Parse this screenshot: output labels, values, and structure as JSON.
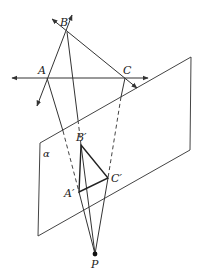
{
  "diagram": {
    "type": "central-projection-geometry",
    "labels": {
      "A": "A",
      "B": "B",
      "C": "C",
      "A_prime": "A′",
      "B_prime": "B′",
      "C_prime": "C′",
      "P": "P",
      "plane": "α"
    },
    "points": {
      "A": [
        47,
        78
      ],
      "B": [
        67,
        32
      ],
      "C": [
        125,
        78
      ],
      "A_prime": [
        79,
        192
      ],
      "B_prime": [
        81,
        145
      ],
      "C_prime": [
        108,
        178
      ],
      "P": [
        95,
        254
      ]
    },
    "plane_corners": [
      [
        40,
        143
      ],
      [
        191,
        57
      ],
      [
        190,
        150
      ],
      [
        38,
        236
      ]
    ],
    "colors": {
      "stroke": "#333333",
      "background": "#ffffff"
    }
  }
}
